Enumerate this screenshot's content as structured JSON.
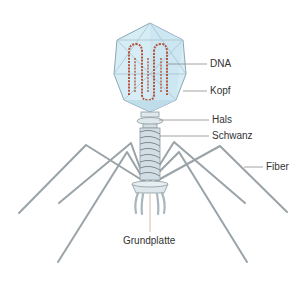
{
  "diagram": {
    "labels": {
      "dna": "DNA",
      "kopf": "Kopf",
      "hals": "Hals",
      "schwanz": "Schwanz",
      "fiber": "Fiber",
      "grundplatte": "Grundplatte"
    },
    "colors": {
      "head_fill": "#cfe9f3",
      "head_stroke": "#8aa7b4",
      "dna": "#b5533c",
      "tail": "#c9d7de",
      "fiber": "#9aa3a8",
      "leader_line": "#8a8a8a",
      "text": "#333333"
    }
  }
}
